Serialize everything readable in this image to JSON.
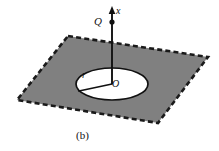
{
  "figure": {
    "caption": "(b)",
    "labels": {
      "axis": "x",
      "charge": "Q",
      "radius": "r",
      "origin": "O"
    },
    "colors": {
      "plane_fill": "#808080",
      "plane_border": "#1a1a1a",
      "hole_fill": "#ffffff",
      "hole_border": "#111111",
      "axis": "#111111",
      "background": "#ffffff",
      "text": "#111111"
    },
    "geometry": {
      "plane_corners": [
        [
          68,
          36
        ],
        [
          208,
          57
        ],
        [
          158,
          123
        ],
        [
          17,
          100
        ]
      ],
      "hole_center": [
        112,
        84
      ],
      "hole_rx": 36,
      "hole_ry": 16,
      "axis_top": [
        112,
        8
      ],
      "axis_bottom": [
        112,
        84
      ],
      "charge_point": [
        112,
        22
      ],
      "radius_line_end": [
        79,
        91
      ]
    }
  }
}
